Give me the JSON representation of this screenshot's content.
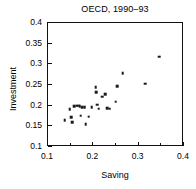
{
  "chart_data": {
    "type": "scatter",
    "title": "OECD, 1990–93",
    "xlabel": "Saving",
    "ylabel": "Investment",
    "xlim": [
      0.1,
      0.4
    ],
    "ylim": [
      0.1,
      0.4
    ],
    "xticks": [
      0.1,
      0.2,
      0.3,
      0.4
    ],
    "xticklabels": [
      "0.1",
      "0.2",
      "0.3",
      "0.4"
    ],
    "xminorticks": [
      0.15,
      0.25,
      0.35
    ],
    "yticks": [
      0.1,
      0.15,
      0.2,
      0.25,
      0.3,
      0.35,
      0.4
    ],
    "yticklabels": [
      "0.1",
      "0.15",
      "0.2",
      "0.25",
      "0.3",
      "0.35",
      "0.4"
    ],
    "grid": false,
    "legend": null,
    "marker": "square",
    "marker_color": "#1a1a1a",
    "points": [
      {
        "x": 0.137,
        "y": 0.165
      },
      {
        "x": 0.148,
        "y": 0.191
      },
      {
        "x": 0.151,
        "y": 0.172
      },
      {
        "x": 0.154,
        "y": 0.16
      },
      {
        "x": 0.158,
        "y": 0.199
      },
      {
        "x": 0.163,
        "y": 0.2
      },
      {
        "x": 0.166,
        "y": 0.2
      },
      {
        "x": 0.17,
        "y": 0.199
      },
      {
        "x": 0.172,
        "y": 0.176
      },
      {
        "x": 0.176,
        "y": 0.197
      },
      {
        "x": 0.181,
        "y": 0.197
      },
      {
        "x": 0.183,
        "y": 0.155
      },
      {
        "x": 0.19,
        "y": 0.173
      },
      {
        "x": 0.196,
        "y": 0.196
      },
      {
        "x": 0.205,
        "y": 0.245
      },
      {
        "x": 0.206,
        "y": 0.233
      },
      {
        "x": 0.208,
        "y": 0.202
      },
      {
        "x": 0.212,
        "y": 0.193
      },
      {
        "x": 0.219,
        "y": 0.222
      },
      {
        "x": 0.226,
        "y": 0.228
      },
      {
        "x": 0.231,
        "y": 0.194
      },
      {
        "x": 0.236,
        "y": 0.193
      },
      {
        "x": 0.249,
        "y": 0.21
      },
      {
        "x": 0.253,
        "y": 0.247
      },
      {
        "x": 0.265,
        "y": 0.279
      },
      {
        "x": 0.314,
        "y": 0.253
      },
      {
        "x": 0.345,
        "y": 0.318
      }
    ]
  }
}
